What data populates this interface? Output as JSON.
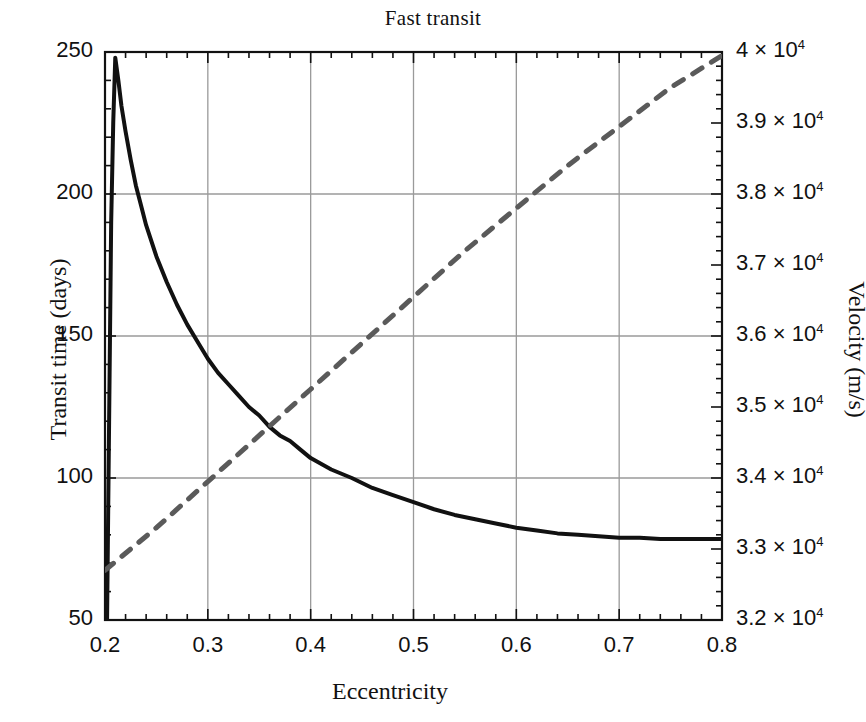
{
  "chart_data": {
    "type": "line",
    "title": "Fast transit",
    "xlabel": "Eccentricity",
    "ylabel": "Transit time (days)",
    "ylabel_right": "Velocity (m/s)",
    "xlim": [
      0.2,
      0.8
    ],
    "ylim": [
      50,
      250
    ],
    "ylim_right": [
      32000,
      40000
    ],
    "grid": true,
    "legend": "none",
    "xticks": [
      0.2,
      0.3,
      0.4,
      0.5,
      0.6,
      0.7,
      0.8
    ],
    "xticklabels": [
      "0.2",
      "0.3",
      "0.4",
      "0.5",
      "0.6",
      "0.7",
      "0.8"
    ],
    "yticks_left": [
      50,
      100,
      150,
      200,
      250
    ],
    "yticklabels_left": [
      "50",
      "100",
      "150",
      "200",
      "250"
    ],
    "yticks_right": [
      32000,
      33000,
      34000,
      35000,
      36000,
      37000,
      38000,
      39000,
      40000
    ],
    "yticklabels_right": [
      {
        "mantissa": "3.2 × 10",
        "exponent": "4"
      },
      {
        "mantissa": "3.3 × 10",
        "exponent": "4"
      },
      {
        "mantissa": "3.4 × 10",
        "exponent": "4"
      },
      {
        "mantissa": "3.5 × 10",
        "exponent": "4"
      },
      {
        "mantissa": "3.6 × 10",
        "exponent": "4"
      },
      {
        "mantissa": "3.7 × 10",
        "exponent": "4"
      },
      {
        "mantissa": "3.8 × 10",
        "exponent": "4"
      },
      {
        "mantissa": "3.9 × 10",
        "exponent": "4"
      },
      {
        "mantissa": "4 × 10",
        "exponent": "4"
      }
    ],
    "minor_ticks_per_major_x": 5,
    "minor_ticks_per_major_y": 5,
    "series": [
      {
        "name": "Transit time",
        "axis": "left",
        "style": "solid",
        "color": "#111111",
        "width": 4,
        "x": [
          0.202,
          0.204,
          0.206,
          0.208,
          0.21,
          0.213,
          0.216,
          0.22,
          0.225,
          0.23,
          0.235,
          0.24,
          0.25,
          0.26,
          0.27,
          0.28,
          0.29,
          0.3,
          0.31,
          0.32,
          0.33,
          0.34,
          0.35,
          0.36,
          0.37,
          0.38,
          0.39,
          0.4,
          0.42,
          0.44,
          0.46,
          0.48,
          0.5,
          0.52,
          0.54,
          0.56,
          0.58,
          0.6,
          0.62,
          0.64,
          0.66,
          0.68,
          0.7,
          0.72,
          0.74,
          0.76,
          0.78,
          0.8
        ],
        "y": [
          50,
          120,
          190,
          225,
          248,
          240,
          231,
          222,
          212,
          203,
          196,
          189,
          178,
          169,
          161,
          154,
          148,
          142,
          137,
          133,
          129,
          125,
          122,
          118,
          115,
          113,
          110,
          107,
          103,
          100,
          96.5,
          94,
          91.5,
          89,
          87,
          85.5,
          84,
          82.5,
          81.5,
          80.5,
          80,
          79.5,
          79,
          79,
          78.5,
          78.5,
          78.5,
          78.5
        ]
      },
      {
        "name": "Velocity",
        "axis": "right",
        "style": "dashed",
        "color": "#5a5a5a",
        "width": 5,
        "x": [
          0.2,
          0.25,
          0.3,
          0.35,
          0.4,
          0.45,
          0.5,
          0.55,
          0.6,
          0.65,
          0.7,
          0.75,
          0.8
        ],
        "y": [
          32700,
          33300,
          33950,
          34600,
          35250,
          35900,
          36550,
          37200,
          37800,
          38400,
          38950,
          39500,
          39950
        ]
      }
    ],
    "annotations": []
  },
  "colors": {
    "axis": "#111111",
    "grid": "#9a9a9a",
    "solid_series": "#111111",
    "dashed_series": "#5a5a5a",
    "background": "#ffffff",
    "text": "#111111"
  }
}
